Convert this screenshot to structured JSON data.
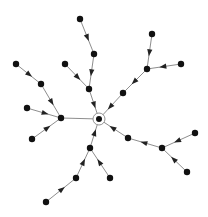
{
  "diagram": {
    "type": "directed-tree",
    "colors": {
      "node": "#111111",
      "edge": "#808080",
      "arrow": "#222222",
      "root_ring": "#888888"
    },
    "root": "n0",
    "nodes": [
      {
        "id": "n0",
        "role": "root"
      },
      {
        "id": "n1"
      },
      {
        "id": "n2"
      },
      {
        "id": "n3"
      },
      {
        "id": "n4"
      },
      {
        "id": "n5"
      },
      {
        "id": "n6"
      },
      {
        "id": "n7"
      },
      {
        "id": "n8"
      },
      {
        "id": "n9"
      },
      {
        "id": "n10"
      },
      {
        "id": "n11"
      },
      {
        "id": "n12"
      },
      {
        "id": "n13"
      },
      {
        "id": "n14"
      },
      {
        "id": "n15"
      },
      {
        "id": "n16"
      },
      {
        "id": "n17"
      },
      {
        "id": "n18"
      },
      {
        "id": "n19"
      },
      {
        "id": "n20"
      },
      {
        "id": "n21"
      },
      {
        "id": "n22"
      }
    ],
    "edges": [
      {
        "from": "n2",
        "to": "n1",
        "arrow": true
      },
      {
        "from": "n3",
        "to": "n2",
        "arrow": true
      },
      {
        "from": "n4",
        "to": "n1",
        "arrow": true
      },
      {
        "from": "n1",
        "to": "n0",
        "arrow": true
      },
      {
        "from": "n6",
        "to": "n5",
        "arrow": true
      },
      {
        "from": "n7",
        "to": "n6",
        "arrow": true
      },
      {
        "from": "n8",
        "to": "n5",
        "arrow": true
      },
      {
        "from": "n9",
        "to": "n5",
        "arrow": true
      },
      {
        "from": "n5",
        "to": "n0",
        "arrow": false
      },
      {
        "from": "n11",
        "to": "n10",
        "arrow": true
      },
      {
        "from": "n12",
        "to": "n11",
        "arrow": true
      },
      {
        "from": "n13",
        "to": "n12",
        "arrow": true
      },
      {
        "from": "n14",
        "to": "n12",
        "arrow": true
      },
      {
        "from": "n10",
        "to": "n0",
        "arrow": true
      },
      {
        "from": "n16",
        "to": "n15",
        "arrow": true
      },
      {
        "from": "n17",
        "to": "n16",
        "arrow": true
      },
      {
        "from": "n18",
        "to": "n16",
        "arrow": true
      },
      {
        "from": "n15",
        "to": "n0",
        "arrow": true
      },
      {
        "from": "n20",
        "to": "n19",
        "arrow": true
      },
      {
        "from": "n21",
        "to": "n20",
        "arrow": true
      },
      {
        "from": "n22",
        "to": "n19",
        "arrow": true
      },
      {
        "from": "n19",
        "to": "n0",
        "arrow": true
      }
    ]
  }
}
